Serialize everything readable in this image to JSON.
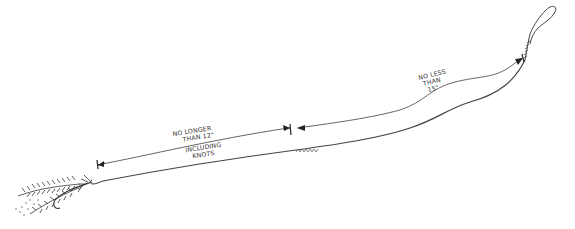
{
  "diagram": {
    "type": "fishing-leader-illustration",
    "labels": {
      "tippet_section": {
        "line1": "NO LONGER",
        "line2": "THAN 12\"",
        "line3": "INCLUDING",
        "line4": "KNOTS"
      },
      "butt_section": {
        "line1": "NO LESS",
        "line2": "THAN",
        "line3": "15\""
      }
    },
    "components": [
      "fly",
      "tippet",
      "knot",
      "leader-butt",
      "loop"
    ],
    "colors": {
      "ink": "#333333",
      "background": "#ffffff"
    }
  }
}
